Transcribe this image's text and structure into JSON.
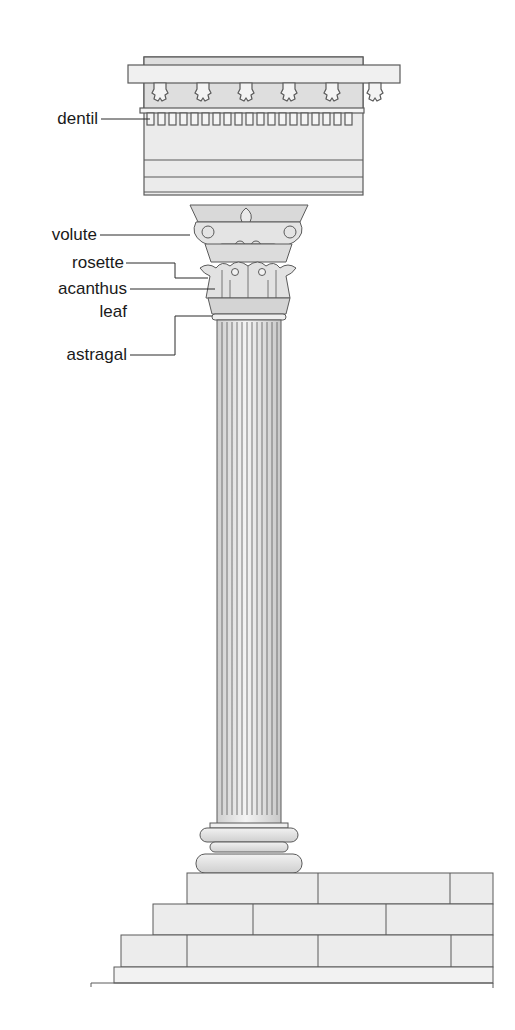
{
  "diagram": {
    "labels": [
      {
        "id": "dentil",
        "text": "dentil"
      },
      {
        "id": "volute",
        "text": "volute"
      },
      {
        "id": "rosette",
        "text": "rosette"
      },
      {
        "id": "acanthus",
        "text": "acanthus"
      },
      {
        "id": "leaf",
        "text": "leaf"
      },
      {
        "id": "astragal",
        "text": "astragal"
      }
    ],
    "colors": {
      "stroke": "#5a5a5a",
      "fill": "#ececec",
      "fill_dark": "#d6d6d6",
      "label_text": "#1a1a1a"
    }
  }
}
